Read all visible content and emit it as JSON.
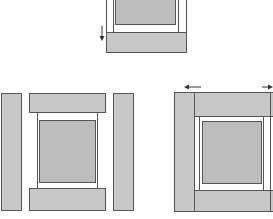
{
  "diagram": {
    "title": "",
    "colors": {
      "piece_fill": "#c8c8c8",
      "panel_fill": "#bdbdbd",
      "outline": "#555555",
      "background": "#ffffff"
    },
    "figures": [
      {
        "id": "top-partial-assembly",
        "parts": [
          "inner-frame",
          "center-panel",
          "bottom-rail"
        ],
        "arrows": [
          {
            "direction": "down"
          }
        ]
      },
      {
        "id": "exploded-assembly",
        "parts": [
          "left-stile",
          "top-rail",
          "inner-frame",
          "center-panel",
          "bottom-rail",
          "right-stile"
        ]
      },
      {
        "id": "assembled-with-arrows",
        "parts": [
          "left-stile",
          "top-rail",
          "inner-frame",
          "center-panel",
          "bottom-rail"
        ],
        "arrows": [
          {
            "direction": "left"
          },
          {
            "direction": "right"
          }
        ]
      }
    ]
  }
}
